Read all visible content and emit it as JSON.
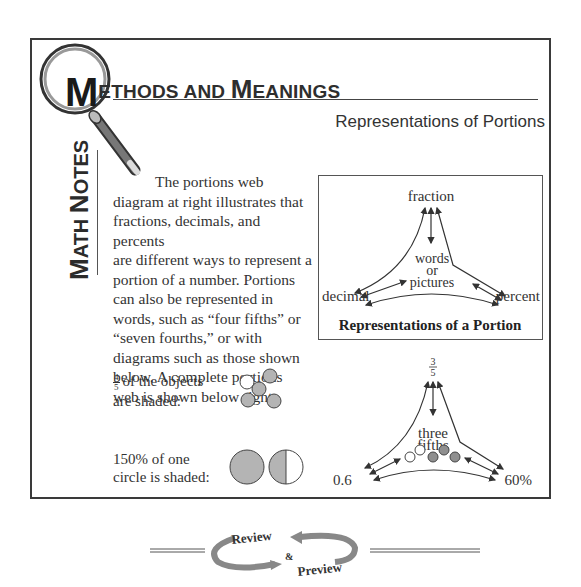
{
  "header": {
    "title_first_letter": "M",
    "title_rest_1": "ETHODS AND ",
    "title_cap_2": "M",
    "title_rest_2": "EANINGS",
    "side_label_cap_1": "M",
    "side_label_rest_1": "ATH ",
    "side_label_cap_2": "N",
    "side_label_rest_2": "OTES",
    "subtitle": "Representations of Portions"
  },
  "body": {
    "lines": [
      "The portions web",
      "diagram at right illustrates that",
      "fractions, decimals, and percents",
      "are different ways to represent a",
      "portion of a number.  Portions",
      "can also be represented in",
      "words, such as “four fifths” or",
      "“seven fourths,” or with",
      "diagrams such as those shown",
      "below.  A complete portions",
      "web is shown below right."
    ]
  },
  "examples": [
    {
      "fraction_num": "4",
      "fraction_den": "5",
      "line1": "of the objects",
      "line2": "are shaded:",
      "objects_shaded": 4,
      "objects_total": 5
    },
    {
      "line1": "150% of one",
      "line2": "circle is shaded:",
      "percent": 150
    }
  ],
  "web_diagram": {
    "top": "fraction",
    "center_lines": [
      "words",
      "or",
      "pictures"
    ],
    "left": "decimal",
    "right": "percent",
    "caption": "Representations of a Portion"
  },
  "example_web": {
    "top_num": "3",
    "top_den": "5",
    "center_lines": [
      "three",
      "fifths"
    ],
    "left": "0.6",
    "right": "60%",
    "circles_shaded": 3,
    "circles_total": 5
  },
  "footer": {
    "review": "Review",
    "amp": "&",
    "preview": "Preview"
  },
  "colors": {
    "frame": "#3a3a3a",
    "shade": "#b4b4b4",
    "arrow_gray": "#8a8a8a",
    "text": "#2e2e2e"
  }
}
